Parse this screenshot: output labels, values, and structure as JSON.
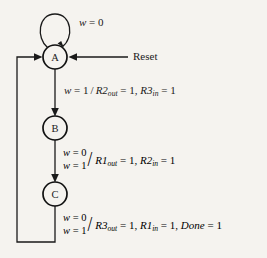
{
  "diagram": {
    "background_color": "#f5f3ef",
    "ink_color": "#1a1a1a",
    "states": [
      {
        "id": "A",
        "label": "A",
        "cx": 55,
        "cy": 57,
        "r": 12
      },
      {
        "id": "B",
        "label": "B",
        "cx": 55,
        "cy": 128,
        "r": 12
      },
      {
        "id": "C",
        "label": "C",
        "cx": 55,
        "cy": 194,
        "r": 12
      }
    ],
    "external_inputs": [
      {
        "name": "reset",
        "label": "Reset",
        "target_state": "A"
      }
    ],
    "transitions": [
      {
        "from": "A",
        "to": "A",
        "kind": "self-loop",
        "condition_lines": [
          "w = 0"
        ],
        "outputs": [],
        "label_plain": "w = 0"
      },
      {
        "from": "A",
        "to": "B",
        "kind": "forward",
        "condition_lines": [
          "w = 1"
        ],
        "outputs": [
          "R2out = 1",
          "R3in = 1"
        ],
        "label_plain": "w = 1 / R2out = 1, R3in = 1"
      },
      {
        "from": "B",
        "to": "C",
        "kind": "forward",
        "condition_lines": [
          "w = 0",
          "w = 1"
        ],
        "outputs": [
          "R1out = 1",
          "R2in = 1"
        ],
        "label_plain": "w = 0 / w = 1 / R1out = 1, R2in = 1"
      },
      {
        "from": "C",
        "to": "A",
        "kind": "feedback",
        "condition_lines": [
          "w = 0",
          "w = 1"
        ],
        "outputs": [
          "R3out = 1",
          "R1in = 1",
          "Done = 1"
        ],
        "label_plain": "w = 0 / w = 1 / R3out = 1, R1in = 1, Done = 1"
      }
    ],
    "labels": {
      "self_loop_w": {
        "var": "w",
        "eq": " = ",
        "val": "0"
      },
      "reset": "Reset",
      "ab": {
        "cond_var": "w",
        "cond_val": "1",
        "slash": "/",
        "o1_base": "R2",
        "o1_sub": "out",
        "o1_val": "1",
        "sep": ", ",
        "o2_base": "R3",
        "o2_sub": "in",
        "o2_val": "1"
      },
      "bc": {
        "row1_var": "w",
        "row1_val": "0",
        "row2_var": "w",
        "row2_val": "1",
        "slash": "/",
        "o1_base": "R1",
        "o1_sub": "out",
        "o1_val": "1",
        "sep": ", ",
        "o2_base": "R2",
        "o2_sub": "in",
        "o2_val": "1"
      },
      "ca": {
        "row1_var": "w",
        "row1_val": "0",
        "row2_var": "w",
        "row2_val": "1",
        "slash": "/",
        "o1_base": "R3",
        "o1_sub": "out",
        "o1_val": "1",
        "sep1": ", ",
        "o2_base": "R1",
        "o2_sub": "in",
        "o2_val": "1",
        "sep2": ", ",
        "o3_base": "Done",
        "o3_val": "1"
      },
      "equals": "=",
      "one": "1"
    }
  }
}
